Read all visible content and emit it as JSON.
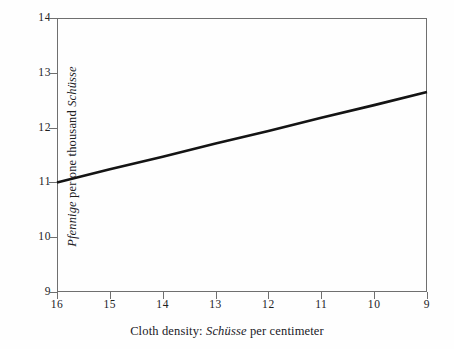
{
  "chart_data": {
    "type": "line",
    "title": "",
    "xlabel_parts": {
      "prefix": "Cloth density: ",
      "italic": "Schüsse",
      "suffix": " per centimeter"
    },
    "ylabel_parts": {
      "italic_lead": "Pfennige",
      "middle": " per one thousand ",
      "italic_tail": "Schüsse"
    },
    "xlabel": "Cloth density: Schüsse per centimeter",
    "ylabel": "Pfennige per one thousand Schüsse",
    "x_ticks": [
      "16",
      "15",
      "14",
      "13",
      "12",
      "11",
      "10",
      "9"
    ],
    "x_tick_values": [
      16,
      15,
      14,
      13,
      12,
      11,
      10,
      9
    ],
    "y_ticks": [
      "14",
      "13",
      "12",
      "11",
      "10",
      "9"
    ],
    "y_tick_values": [
      14,
      13,
      12,
      11,
      10,
      9
    ],
    "xlim": [
      16,
      9
    ],
    "ylim": [
      9,
      14
    ],
    "x_axis_reversed": true,
    "grid": false,
    "legend": false,
    "series": [
      {
        "name": "price per thousand Schüsse",
        "x": [
          16,
          15,
          14,
          13,
          12,
          11,
          10,
          9
        ],
        "y": [
          11.0,
          11.24,
          11.47,
          11.71,
          11.94,
          12.18,
          12.41,
          12.65
        ],
        "color": "#141414",
        "line_width": 2.6
      }
    ],
    "frame_color": "#6f6f6f",
    "background_color": "#fefefe"
  }
}
